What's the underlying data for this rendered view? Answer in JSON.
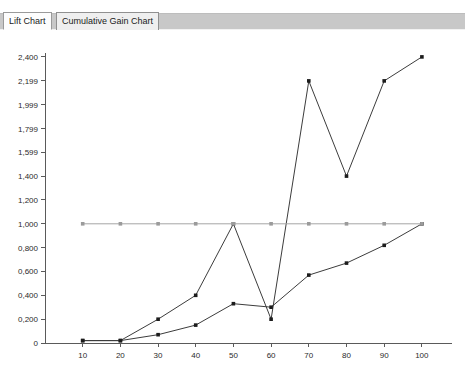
{
  "window": {
    "tabs": [
      {
        "id": "lift",
        "label": "Lift Chart",
        "selected": true
      },
      {
        "id": "cumulative",
        "label": "Cumulative Gain Chart",
        "selected": false
      }
    ]
  },
  "colors": {
    "spiky_series": "#3c3c3c",
    "smooth_series": "#3c3c3c",
    "baseline_series": "#a6a6a6",
    "axis": "#5a5a5a",
    "tab_band": "#c8c8c8",
    "plot_background": "#ffffff"
  },
  "chart_data": {
    "type": "line",
    "title": "",
    "subtitle": "",
    "xlabel": "",
    "ylabel": "",
    "x": [
      10,
      20,
      30,
      40,
      50,
      60,
      70,
      80,
      90,
      100
    ],
    "xticklabels": [
      "10",
      "20",
      "30",
      "40",
      "50",
      "60",
      "70",
      "80",
      "90",
      "100"
    ],
    "yticks": [
      0,
      0.2,
      0.4,
      0.6,
      0.8,
      1.0,
      1.2,
      1.4,
      1.599,
      1.799,
      1.999,
      2.199,
      2.4
    ],
    "yticklabels": [
      "0",
      "0,200",
      "0,400",
      "0,600",
      "0,800",
      "1,000",
      "1,200",
      "1,400",
      "1,599",
      "1,799",
      "1,999",
      "2,199",
      "2,400"
    ],
    "xlim": [
      0,
      108
    ],
    "ylim": [
      0,
      2.5
    ],
    "grid": false,
    "legend": "none",
    "series": [
      {
        "name": "Model Lift",
        "color": "#3c3c3c",
        "marker": "square",
        "values": [
          0.02,
          0.02,
          0.2,
          0.4,
          1.0,
          0.2,
          2.199,
          1.4,
          2.199,
          2.4
        ]
      },
      {
        "name": "Ideal Model",
        "color": "#3c3c3c",
        "marker": "square",
        "values": [
          0.02,
          0.02,
          0.07,
          0.15,
          0.33,
          0.3,
          0.57,
          0.67,
          0.82,
          1.0
        ]
      },
      {
        "name": "Random Guess",
        "color": "#a6a6a6",
        "marker": "square",
        "values": [
          1.0,
          1.0,
          1.0,
          1.0,
          1.0,
          1.0,
          1.0,
          1.0,
          1.0,
          1.0
        ]
      }
    ]
  }
}
